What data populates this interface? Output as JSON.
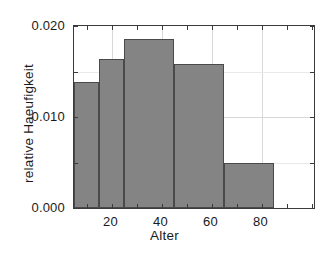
{
  "chart_data": {
    "type": "bar",
    "title": "",
    "subtitle": "",
    "xlabel": "Alter",
    "ylabel": "relative Haeufigkeit",
    "xlim": [
      5,
      101
    ],
    "ylim": [
      0.0,
      0.02
    ],
    "grid": true,
    "legend": null,
    "bar_color": "#848484",
    "bar_edge_color": "#4a4a4a",
    "axis_color": "#3a3a3a",
    "grid_color": "#d8d8d8",
    "background": "#ffffff",
    "categories": [
      "5-15",
      "15-25",
      "25-45",
      "45-65",
      "65-85"
    ],
    "bin_edges": [
      5,
      15,
      25,
      45,
      65,
      85
    ],
    "values": [
      0.0138,
      0.0164,
      0.0186,
      0.0158,
      0.0049
    ],
    "bars": [
      {
        "label": "5-15",
        "x_start": 5,
        "x_end": 15,
        "value": 0.0138
      },
      {
        "label": "15-25",
        "x_start": 15,
        "x_end": 25,
        "value": 0.0164
      },
      {
        "label": "25-45",
        "x_start": 25,
        "x_end": 45,
        "value": 0.0186
      },
      {
        "label": "45-65",
        "x_start": 45,
        "x_end": 65,
        "value": 0.0158
      },
      {
        "label": "65-85",
        "x_start": 65,
        "x_end": 85,
        "value": 0.0049
      }
    ],
    "xticks": [
      {
        "value": 20,
        "label": "20"
      },
      {
        "value": 40,
        "label": "40"
      },
      {
        "value": 60,
        "label": "60"
      },
      {
        "value": 80,
        "label": "80"
      }
    ],
    "xticks_minor": [
      10,
      30,
      50,
      70,
      90,
      100
    ],
    "yticks": [
      {
        "value": 0.0,
        "label": "0.000"
      },
      {
        "value": 0.01,
        "label": "0.010"
      },
      {
        "value": 0.02,
        "label": "0.020"
      }
    ],
    "yticks_minor": [
      0.005,
      0.015
    ]
  }
}
